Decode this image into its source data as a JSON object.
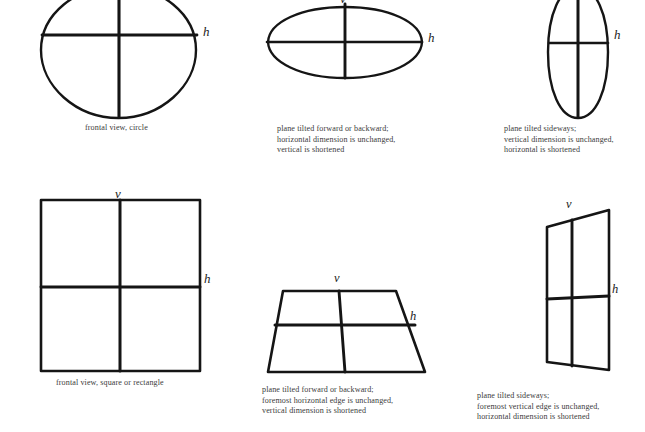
{
  "figure": {
    "background_color": "#ffffff",
    "ink_color": "#151515",
    "caption_color": "#3b3b3b"
  },
  "labels": {
    "vertical": "v",
    "horizontal": "h"
  },
  "panels": [
    {
      "id": "circle-frontal",
      "shape": "circle",
      "caption": "frontal view, circle",
      "axis_labels": [
        "v",
        "h"
      ]
    },
    {
      "id": "ellipse-horizontal",
      "shape": "ellipse-wide",
      "caption": "plane tilted forward or backward;\nhorizontal dimension is unchanged,\nvertical is shortened",
      "axis_labels": [
        "v",
        "h"
      ]
    },
    {
      "id": "ellipse-vertical",
      "shape": "ellipse-tall",
      "caption": "plane tilted sideways;\nvertical dimension is unchanged,\nhorizontal is shortened",
      "axis_labels": [
        "v",
        "h"
      ]
    },
    {
      "id": "square-frontal",
      "shape": "square",
      "caption": "frontal view, square or rectangle",
      "axis_labels": [
        "v",
        "h"
      ]
    },
    {
      "id": "trapezoid-forward",
      "shape": "trapezoid",
      "caption": "plane tilted forward or backward;\nforemost horizontal edge  is unchanged,\nvertical  dimension is shortened",
      "axis_labels": [
        "v",
        "h"
      ]
    },
    {
      "id": "parallelogram-sideways",
      "shape": "quadrilateral",
      "caption": "plane tilted sideways;\nforemost vertical edge  is unchanged,\nhorizontal  dimension is shortened",
      "axis_labels": [
        "v",
        "h"
      ]
    }
  ]
}
